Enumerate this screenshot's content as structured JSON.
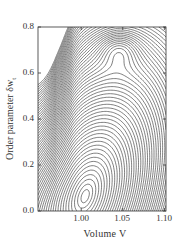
{
  "chart_data": {
    "type": "contour",
    "title": "",
    "xlabel": "Volume  V",
    "ylabel": "Order parameter  δw",
    "ylabel_subscript": "t",
    "xlim": [
      0.948,
      1.102
    ],
    "ylim": [
      0.0,
      0.8
    ],
    "x_ticks": [
      {
        "value": 1.0,
        "label": "1.00"
      },
      {
        "value": 1.05,
        "label": "1.05"
      },
      {
        "value": 1.1,
        "label": "1.10"
      }
    ],
    "y_ticks": [
      {
        "value": 0.0,
        "label": "0.0"
      },
      {
        "value": 0.2,
        "label": "0.2"
      },
      {
        "value": 0.4,
        "label": "0.4"
      },
      {
        "value": 0.6,
        "label": "0.6"
      },
      {
        "value": 0.8,
        "label": "0.8"
      }
    ],
    "features": [
      {
        "kind": "saddle/minimum valley",
        "x": 1.005,
        "y": 0.07
      },
      {
        "kind": "closed contour island (local extremum)",
        "x": 1.045,
        "y": 0.71
      },
      {
        "kind": "steep dense-contour region",
        "x": 0.96,
        "y": 0.7
      }
    ],
    "contour_levels": 60,
    "line_color": "#2a2a2a",
    "grid": false,
    "legend": null
  },
  "plot_frame": {
    "left": 38,
    "top": 27,
    "right": 166,
    "bottom": 211
  }
}
